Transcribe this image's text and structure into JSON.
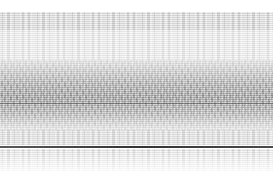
{
  "image": {
    "description": "abstract grayscale noise texture with horizontal banding",
    "width": 273,
    "height": 175,
    "colors": {
      "background": "#ffffff",
      "light_band": "#e6e6e6",
      "mid_band": "#bdbdbd",
      "dark_band": "#8c8c8c",
      "sharp_line": "#3a3a3a"
    },
    "bands": [
      {
        "name": "top-light-texture",
        "y": 12,
        "h": 18
      },
      {
        "name": "upper-pale",
        "y": 30,
        "h": 30
      },
      {
        "name": "dense-dark",
        "y": 60,
        "h": 70
      },
      {
        "name": "lower-light",
        "y": 130,
        "h": 15
      },
      {
        "name": "sharp-line",
        "y": 146,
        "h": 1
      },
      {
        "name": "bottom-fade",
        "y": 148,
        "h": 27
      }
    ]
  }
}
